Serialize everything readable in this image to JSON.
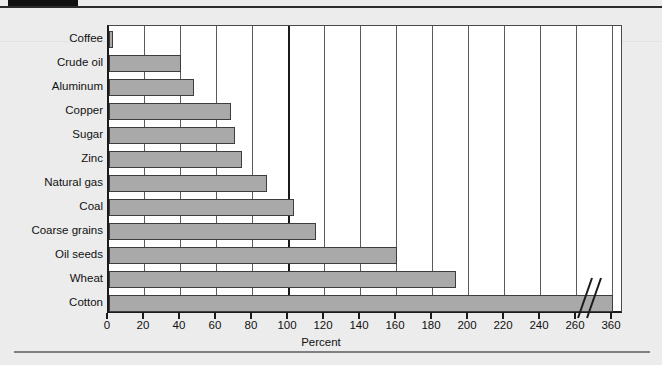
{
  "chart_data": {
    "type": "bar",
    "orientation": "horizontal",
    "title": "",
    "xlabel": "Percent",
    "ylabel": "",
    "categories": [
      "Coffee",
      "Crude oil",
      "Aluminum",
      "Copper",
      "Sugar",
      "Zinc",
      "Natural gas",
      "Coal",
      "Coarse grains",
      "Oil seeds",
      "Wheat",
      "Cotton"
    ],
    "values": [
      2,
      40,
      47,
      68,
      70,
      74,
      88,
      103,
      115,
      160,
      193,
      360
    ],
    "xlim": [
      0,
      360
    ],
    "xticks": [
      0,
      20,
      40,
      60,
      80,
      100,
      120,
      140,
      160,
      180,
      200,
      220,
      240,
      260,
      360
    ],
    "xtick_labels": [
      "0",
      "20",
      "40",
      "60",
      "80",
      "100",
      "120",
      "140",
      "160",
      "180",
      "200",
      "220",
      "240",
      "260",
      "360"
    ],
    "axis_break": {
      "after": 260,
      "before": 360
    },
    "grid": true,
    "emphasized_gridline": 100,
    "legend": null,
    "bar_color": "#a9a9a9",
    "bar_edge_color": "#3d3d3d",
    "plot_background": "#ffffff",
    "page_background": "#ececec"
  },
  "figure": {
    "x_axis_title": "Percent"
  }
}
